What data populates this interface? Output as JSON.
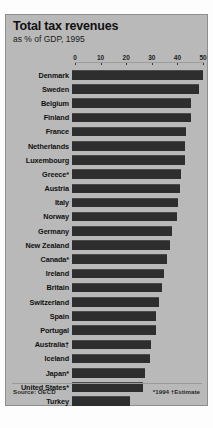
{
  "chart_data": {
    "type": "bar",
    "orientation": "horizontal",
    "title": "Total tax revenues",
    "subtitle": "as % of GDP, 1995",
    "xlabel": "",
    "ylabel": "",
    "xlim": [
      0,
      50
    ],
    "ticks": [
      0,
      10,
      20,
      30,
      40,
      50
    ],
    "grid": false,
    "legend": null,
    "source": "Source: OECD",
    "footnote": "*1994  †Estimate",
    "bar_color": "#2e2e2e",
    "panel_color": "#b9b9b9",
    "categories": [
      "Denmark",
      "Sweden",
      "Belgium",
      "Finland",
      "France",
      "Netherlands",
      "Luxembourg",
      "Greece*",
      "Austria",
      "Italy",
      "Norway",
      "Germany",
      "New Zealand",
      "Canada*",
      "Ireland",
      "Britain",
      "Switzerland",
      "Spain",
      "Portugal",
      "Australia†",
      "Iceland",
      "Japan*",
      "United States*",
      "Turkey"
    ],
    "values": [
      51.3,
      49.7,
      46.5,
      46.5,
      44.5,
      44.0,
      44.0,
      42.5,
      42.0,
      41.3,
      41.0,
      39.2,
      38.2,
      37.0,
      35.8,
      35.3,
      33.9,
      33.0,
      33.0,
      30.9,
      30.5,
      28.5,
      27.9,
      22.5
    ]
  },
  "panel": {
    "title": "Total tax revenues",
    "subtitle": "as % of GDP, 1995",
    "source": "Source: OECD",
    "footnote": "*1994  †Estimate"
  }
}
